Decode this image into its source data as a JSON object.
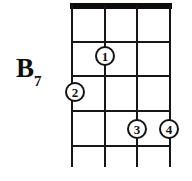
{
  "diagram": {
    "chord": {
      "root": "B",
      "quality": "7",
      "full_label": "B7"
    },
    "colors": {
      "ink": "#181715",
      "nut": "#0d0c0b",
      "background": "#ffffff"
    },
    "fretboard": {
      "string_count": 4,
      "fret_count": 4,
      "nut_visible": true,
      "strings_x": [
        72,
        105,
        137,
        170
      ],
      "frets_y": [
        41,
        75,
        110,
        145
      ],
      "nut_y": 5,
      "strings_bottom_y": 167
    },
    "fingers": [
      {
        "label": "1",
        "x": 105,
        "y": 56,
        "string_index": 1,
        "fret": 2
      },
      {
        "label": "2",
        "x": 75,
        "y": 92,
        "string_index": 0,
        "fret": 3
      },
      {
        "label": "3",
        "x": 137,
        "y": 129,
        "string_index": 2,
        "fret": 4
      },
      {
        "label": "4",
        "x": 169,
        "y": 129,
        "string_index": 3,
        "fret": 4
      }
    ]
  }
}
